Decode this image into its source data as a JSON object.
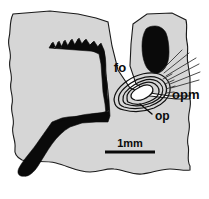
{
  "figure": {
    "type": "anatomical-line-drawing",
    "background_color": "#ffffff",
    "tissue_color": "#d6d6d6",
    "bone_color": "#0a0a0a",
    "outline_color": "#1a1a1a"
  },
  "labels": [
    {
      "id": "fo",
      "text": "fo",
      "x": 120,
      "y": 72,
      "has_leader": false
    },
    {
      "id": "op",
      "text": "op",
      "x": 155,
      "y": 117,
      "has_leader": true
    },
    {
      "id": "opm",
      "text": "opm",
      "x": 172,
      "y": 95,
      "has_leader": false
    }
  ],
  "scale": {
    "label": "1mm",
    "bar_x_start": 105,
    "bar_x_end": 155,
    "bar_y": 152,
    "text_x": 130,
    "text_y": 146
  },
  "structures": {
    "tissue_left_name": "tissue-mass-left",
    "tissue_right_name": "tissue-mass-right",
    "bone_large_name": "bone-large-left",
    "bone_small_name": "bone-small-upper-right",
    "otolith_name": "otolith-concentric-rings",
    "muscle_fibers_name": "otolith-muscle-fibers",
    "ring_count": 5
  }
}
